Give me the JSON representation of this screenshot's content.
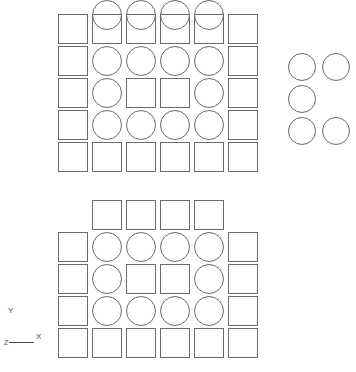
{
  "canvas": {
    "width": 356,
    "height": 372,
    "background": "#ffffff",
    "stroke_color": "#6b6b6b",
    "axis_color": "#4a4a4a"
  },
  "diagram": {
    "cell_pitch_x": 34,
    "cell_pitch_y": 32,
    "shape_size": 30,
    "circle_size": 30
  },
  "grids": [
    {
      "name": "upper-grid",
      "origin_x": 58,
      "origin_y": 14,
      "columns": 6,
      "rows": 5,
      "rows_data": [
        {
          "index": 0,
          "cells": [
            {
              "square": true,
              "circle": false,
              "circle_offset_y": 0
            },
            {
              "square": true,
              "circle": true,
              "circle_offset_y": -14
            },
            {
              "square": true,
              "circle": true,
              "circle_offset_y": -14
            },
            {
              "square": true,
              "circle": true,
              "circle_offset_y": -14
            },
            {
              "square": true,
              "circle": true,
              "circle_offset_y": -14
            },
            {
              "square": true,
              "circle": false,
              "circle_offset_y": 0
            }
          ]
        },
        {
          "index": 1,
          "cells": [
            {
              "square": true,
              "circle": false,
              "circle_offset_y": 0
            },
            {
              "square": false,
              "circle": true,
              "circle_offset_y": 0
            },
            {
              "square": false,
              "circle": true,
              "circle_offset_y": 0
            },
            {
              "square": false,
              "circle": true,
              "circle_offset_y": 0
            },
            {
              "square": false,
              "circle": true,
              "circle_offset_y": 0
            },
            {
              "square": true,
              "circle": false,
              "circle_offset_y": 0
            }
          ]
        },
        {
          "index": 2,
          "cells": [
            {
              "square": true,
              "circle": false,
              "circle_offset_y": 0
            },
            {
              "square": false,
              "circle": true,
              "circle_offset_y": 0
            },
            {
              "square": true,
              "circle": false,
              "circle_offset_y": 0
            },
            {
              "square": true,
              "circle": false,
              "circle_offset_y": 0
            },
            {
              "square": false,
              "circle": true,
              "circle_offset_y": 0
            },
            {
              "square": true,
              "circle": false,
              "circle_offset_y": 0
            }
          ]
        },
        {
          "index": 3,
          "cells": [
            {
              "square": true,
              "circle": false,
              "circle_offset_y": 0
            },
            {
              "square": false,
              "circle": true,
              "circle_offset_y": 0
            },
            {
              "square": false,
              "circle": true,
              "circle_offset_y": 0
            },
            {
              "square": false,
              "circle": true,
              "circle_offset_y": 0
            },
            {
              "square": false,
              "circle": true,
              "circle_offset_y": 0
            },
            {
              "square": true,
              "circle": false,
              "circle_offset_y": 0
            }
          ]
        },
        {
          "index": 4,
          "cells": [
            {
              "square": true,
              "circle": false,
              "circle_offset_y": 0
            },
            {
              "square": true,
              "circle": false,
              "circle_offset_y": 0
            },
            {
              "square": true,
              "circle": false,
              "circle_offset_y": 0
            },
            {
              "square": true,
              "circle": false,
              "circle_offset_y": 0
            },
            {
              "square": true,
              "circle": false,
              "circle_offset_y": 0
            },
            {
              "square": true,
              "circle": false,
              "circle_offset_y": 0
            }
          ]
        }
      ]
    },
    {
      "name": "lower-grid",
      "origin_x": 58,
      "origin_y": 200,
      "columns": 6,
      "rows": 5,
      "rows_data": [
        {
          "index": 0,
          "cells": [
            {
              "square": false,
              "circle": false,
              "circle_offset_y": 0
            },
            {
              "square": true,
              "circle": false,
              "circle_offset_y": 0
            },
            {
              "square": true,
              "circle": false,
              "circle_offset_y": 0
            },
            {
              "square": true,
              "circle": false,
              "circle_offset_y": 0
            },
            {
              "square": true,
              "circle": false,
              "circle_offset_y": 0
            },
            {
              "square": false,
              "circle": false,
              "circle_offset_y": 0
            }
          ]
        },
        {
          "index": 1,
          "cells": [
            {
              "square": true,
              "circle": false,
              "circle_offset_y": 0
            },
            {
              "square": false,
              "circle": true,
              "circle_offset_y": 0
            },
            {
              "square": false,
              "circle": true,
              "circle_offset_y": 0
            },
            {
              "square": false,
              "circle": true,
              "circle_offset_y": 0
            },
            {
              "square": false,
              "circle": true,
              "circle_offset_y": 0
            },
            {
              "square": true,
              "circle": false,
              "circle_offset_y": 0
            }
          ]
        },
        {
          "index": 2,
          "cells": [
            {
              "square": true,
              "circle": false,
              "circle_offset_y": 0
            },
            {
              "square": false,
              "circle": true,
              "circle_offset_y": 0
            },
            {
              "square": true,
              "circle": false,
              "circle_offset_y": 0
            },
            {
              "square": true,
              "circle": false,
              "circle_offset_y": 0
            },
            {
              "square": false,
              "circle": true,
              "circle_offset_y": 0
            },
            {
              "square": true,
              "circle": false,
              "circle_offset_y": 0
            }
          ]
        },
        {
          "index": 3,
          "cells": [
            {
              "square": true,
              "circle": false,
              "circle_offset_y": 0
            },
            {
              "square": false,
              "circle": true,
              "circle_offset_y": 0
            },
            {
              "square": false,
              "circle": true,
              "circle_offset_y": 0
            },
            {
              "square": false,
              "circle": true,
              "circle_offset_y": 0
            },
            {
              "square": false,
              "circle": true,
              "circle_offset_y": 0
            },
            {
              "square": true,
              "circle": false,
              "circle_offset_y": 0
            }
          ]
        },
        {
          "index": 4,
          "cells": [
            {
              "square": true,
              "circle": false,
              "circle_offset_y": 0
            },
            {
              "square": true,
              "circle": false,
              "circle_offset_y": 0
            },
            {
              "square": true,
              "circle": false,
              "circle_offset_y": 0
            },
            {
              "square": true,
              "circle": false,
              "circle_offset_y": 0
            },
            {
              "square": true,
              "circle": false,
              "circle_offset_y": 0
            },
            {
              "square": true,
              "circle": false,
              "circle_offset_y": 0
            }
          ]
        }
      ]
    }
  ],
  "circle_cluster": {
    "name": "detached-circle-cluster",
    "origin_x": 288,
    "origin_y": 53,
    "pitch_x": 34,
    "pitch_y": 32,
    "circle_size": 28,
    "rows": [
      [
        true,
        true
      ],
      [
        true,
        false
      ],
      [
        true,
        true
      ]
    ]
  },
  "axis_indicator": {
    "name": "xy-axis-indicator",
    "y_label": "Y",
    "x_label": "X",
    "origin_label": "Z",
    "y_label_pos": {
      "x": 8,
      "y": 307
    },
    "x_label_pos": {
      "x": 36,
      "y": 333
    },
    "origin_pos": {
      "x": 4,
      "y": 339
    },
    "line_from": {
      "x": 9,
      "y": 342
    },
    "line_to": {
      "x": 34,
      "y": 342
    }
  }
}
